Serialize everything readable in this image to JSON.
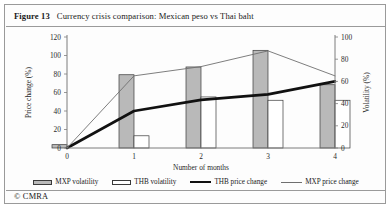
{
  "figure": {
    "number_label": "Figure 13",
    "title": "Currency crisis comparison: Mexican peso vs Thai baht",
    "copyright": "© CMRA"
  },
  "legend": {
    "items": [
      {
        "label": "MXP volatility",
        "swatch": "gray-bar-icon"
      },
      {
        "label": "THB volatility",
        "swatch": "white-bar-icon"
      },
      {
        "label": "THB price change",
        "swatch": "thick-black-line-icon"
      },
      {
        "label": "MXP price change",
        "swatch": "thin-gray-line-icon"
      }
    ]
  },
  "colors": {
    "mxp_volatility_fill": "#b9b9b9",
    "thb_volatility_fill": "#ffffff",
    "bar_stroke": "#3a3a3a",
    "thb_price_line": "#111111",
    "mxp_price_line": "#6f6f6f",
    "axis": "#7d7d7d",
    "frame": "#9a9a9a"
  },
  "chart_data": {
    "type": "bar",
    "title": "Currency crisis comparison: Mexican peso vs Thai baht",
    "xlabel": "Number of months",
    "ylabel": "Price change (%)",
    "y2label": "Volatility (%)",
    "categories": [
      "0",
      "1",
      "2",
      "3",
      "4"
    ],
    "x": [
      0,
      1,
      2,
      3,
      4
    ],
    "ylim": [
      0,
      120
    ],
    "yticks": [
      0,
      20,
      40,
      60,
      80,
      100,
      120
    ],
    "y2lim": [
      0,
      100
    ],
    "y2ticks": [
      0,
      20,
      40,
      60,
      80,
      100
    ],
    "grid": false,
    "legend_position": "bottom",
    "series": [
      {
        "name": "MXP volatility",
        "type": "bar",
        "axis": "right",
        "values": [
          3,
          66,
          73,
          88,
          57
        ]
      },
      {
        "name": "THB volatility",
        "type": "bar",
        "axis": "right",
        "values": [
          0,
          11,
          46,
          43,
          43
        ]
      },
      {
        "name": "THB price change",
        "type": "line",
        "axis": "left",
        "values": [
          0,
          40,
          52,
          58,
          72
        ]
      },
      {
        "name": "MXP price change",
        "type": "line",
        "axis": "left",
        "values": [
          0,
          78,
          88,
          105,
          78
        ]
      }
    ]
  }
}
